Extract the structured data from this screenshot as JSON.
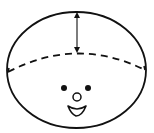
{
  "diagram": {
    "colors": {
      "stroke": "#111111",
      "background": "#ffffff"
    },
    "head": {
      "cx": 76.5,
      "cy": 70,
      "rx": 69.5,
      "ry": 58
    },
    "dashed_arc": {
      "start": [
        8,
        72
      ],
      "control": [
        77,
        36
      ],
      "end": [
        145,
        70
      ],
      "dash": "7,5"
    },
    "arrow": {
      "x": 77,
      "y1": 13,
      "y2": 52
    },
    "face": {
      "left_eye": {
        "cx": 64,
        "cy": 88,
        "r": 3
      },
      "right_eye": {
        "cx": 88,
        "cy": 88,
        "r": 3
      },
      "nose": {
        "cx": 77,
        "cy": 97,
        "r": 4
      },
      "mouth": {
        "path": "M68 106 Q77 112 86 106 Q82 116 76 116 Q71 114 68 106 Z"
      }
    }
  }
}
